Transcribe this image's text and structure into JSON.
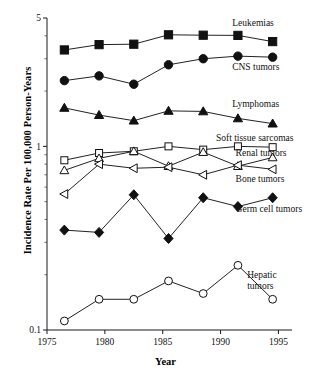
{
  "chart_data": {
    "type": "line",
    "title": "",
    "xlabel": "Year",
    "ylabel": "Incidence Rate Per 100,000 Person-Years",
    "yscale": "log",
    "ylim": [
      0.1,
      5
    ],
    "xlim": [
      1975,
      1996
    ],
    "grid": false,
    "legend_position": "right-inline-labels",
    "ytick_labels": [
      "5",
      "1",
      "0.1"
    ],
    "ytick_values": [
      5,
      1,
      0.1
    ],
    "xtick_labels": [
      "1975",
      "1980",
      "1985",
      "1990",
      "1995"
    ],
    "xtick_values": [
      1975,
      1980,
      1985,
      1990,
      1995
    ],
    "x": [
      1976.5,
      1979.5,
      1982.5,
      1985.5,
      1988.5,
      1991.5,
      1994.5
    ],
    "series": [
      {
        "name": "Leukemias",
        "marker": "filled-square",
        "label": "Leukemias",
        "values": [
          3.35,
          3.58,
          3.6,
          4.05,
          4.03,
          4.02,
          3.72
        ]
      },
      {
        "name": "CNS tumors",
        "marker": "filled-circle",
        "label": "CNS tumors",
        "values": [
          2.28,
          2.42,
          2.18,
          2.78,
          3.0,
          3.1,
          3.06
        ]
      },
      {
        "name": "Lymphomas",
        "marker": "filled-triangle",
        "label": "Lymphomas",
        "values": [
          1.62,
          1.48,
          1.38,
          1.56,
          1.55,
          1.42,
          1.33
        ]
      },
      {
        "name": "Soft tissue sarcomas",
        "marker": "open-square",
        "label": "Soft tissue sarcomas",
        "values": [
          0.84,
          0.92,
          0.94,
          1.0,
          0.96,
          1.0,
          0.99
        ]
      },
      {
        "name": "Renal tumors",
        "marker": "open-triangle-up",
        "label": "Renal tumors",
        "values": [
          0.74,
          0.86,
          0.94,
          0.78,
          0.93,
          0.78,
          0.87
        ]
      },
      {
        "name": "Bone tumors",
        "marker": "open-triangle-left",
        "label": "Bone tumors",
        "values": [
          0.55,
          0.8,
          0.76,
          0.77,
          0.7,
          0.79,
          0.75
        ]
      },
      {
        "name": "Germ cell tumors",
        "marker": "filled-diamond",
        "label": "Germ cell tumors",
        "values": [
          0.35,
          0.34,
          0.545,
          0.315,
          0.525,
          0.47,
          0.525
        ]
      },
      {
        "name": "Hepatic tumors",
        "marker": "open-circle",
        "label": "Hepatic tumors",
        "values": [
          0.112,
          0.147,
          0.147,
          0.185,
          0.158,
          0.225,
          0.147
        ]
      }
    ],
    "annotations": [
      {
        "text": "Leukemias",
        "x": 1991.0,
        "y": 4.75
      },
      {
        "text": "CNS tumors",
        "x": 1991.0,
        "y": 2.72
      },
      {
        "text": "Lymphomas",
        "x": 1991.0,
        "y": 1.72
      },
      {
        "text": "Soft tissue sarcomas",
        "x": 1989.6,
        "y": 1.12
      },
      {
        "text": "Renal tumors",
        "x": 1991.3,
        "y": 0.93
      },
      {
        "text": "Bone tumors",
        "x": 1991.3,
        "y": 0.67
      },
      {
        "text": "Germ cell tumors",
        "x": 1991.3,
        "y": 0.46
      },
      {
        "text": "Hepatic tumors",
        "x": 1992.3,
        "y": 0.2
      }
    ]
  }
}
